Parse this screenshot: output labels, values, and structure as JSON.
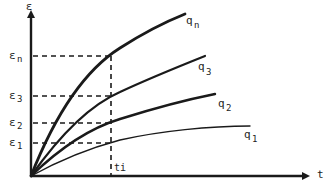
{
  "diagram": {
    "title": "",
    "axes": {
      "y_label": "ε",
      "x_label": "t"
    },
    "y_ticks": [
      {
        "label": "εn",
        "main": "ε",
        "sub": "n"
      },
      {
        "label": "ε3",
        "main": "ε",
        "sub": "3"
      },
      {
        "label": "ε2",
        "main": "ε",
        "sub": "2"
      },
      {
        "label": "ε1",
        "main": "ε",
        "sub": "1"
      }
    ],
    "x_tick": {
      "label": "ti"
    },
    "curves": [
      {
        "label": "qn",
        "main": "q",
        "sub": "n"
      },
      {
        "label": "q3",
        "main": "q",
        "sub": "3"
      },
      {
        "label": "q2",
        "main": "q",
        "sub": "2"
      },
      {
        "label": "q1",
        "main": "q",
        "sub": "1"
      }
    ],
    "colors": {
      "ink": "#1a1a1a",
      "background": "#ffffff"
    }
  }
}
